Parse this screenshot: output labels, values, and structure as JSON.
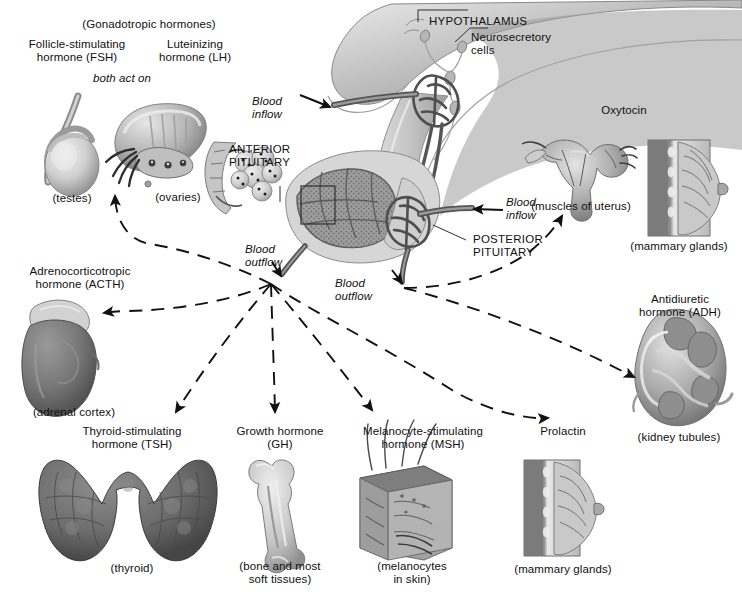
{
  "figure": {
    "title_text_blocks": {
      "gonadotropic_group": "(Gonadotropic hormones)",
      "fsh": "Follicle-stimulating\nhormone (FSH)",
      "lh": "Luteinizing\nhormone (LH)",
      "both_act_on": "both act on",
      "testes": "(testes)",
      "ovaries": "(ovaries)"
    },
    "central": {
      "hypothalamus": "HYPOTHALAMUS",
      "neurosecretory_cells": "Neurosecretory\ncells",
      "anterior_pituitary": "ANTERIOR\nPITUITARY",
      "posterior_pituitary": "POSTERIOR\nPITUITARY",
      "blood_inflow_upper": "Blood\ninflow",
      "blood_inflow_lower": "Blood\ninflow",
      "blood_outflow_anterior": "Blood\noutflow",
      "blood_outflow_posterior": "Blood\noutflow"
    },
    "hormones": [
      {
        "id": "acth",
        "name": "Adrenocorticotropic\nhormone (ACTH)",
        "target": "(adrenal cortex)"
      },
      {
        "id": "tsh",
        "name": "Thyroid-stimulating\nhormone (TSH)",
        "target": "(thyroid)"
      },
      {
        "id": "gh",
        "name": "Growth hormone\n(GH)",
        "target": "(bone and most\nsoft tissues)"
      },
      {
        "id": "msh",
        "name": "Melanocyte-stimulating\nhormone (MSH)",
        "target": "(melanocytes\nin skin)"
      },
      {
        "id": "prolactin",
        "name": "Prolactin",
        "target": "(mammary glands)"
      },
      {
        "id": "oxytocin",
        "name": "Oxytocin",
        "target_uterus": "(muscles of uterus)",
        "target_mammary": "(mammary glands)"
      },
      {
        "id": "adh",
        "name": "Antidiuretic\nhormone (ADH)",
        "target": "(kidney tubules)"
      }
    ],
    "colors": {
      "ink": "#101010",
      "line": "#111111",
      "tissue_light": "#d8d8d8",
      "tissue_mid": "#a9a9a9",
      "tissue_dark": "#6f6f6f",
      "vessel": "#4a4a4a",
      "background": "#ffffff"
    }
  }
}
